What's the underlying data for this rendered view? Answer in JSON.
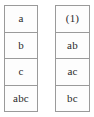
{
  "figure": {
    "type": "two-column-table-pair",
    "background_color": "#ffffff",
    "border_color": "#9a9a9a",
    "text_color": "#2a2a2a"
  },
  "tables": [
    {
      "name": "left-table",
      "rows": [
        {
          "value": "a"
        },
        {
          "value": "b"
        },
        {
          "value": "c"
        },
        {
          "value": "abc"
        }
      ]
    },
    {
      "name": "right-table",
      "rows": [
        {
          "value": "(1)"
        },
        {
          "value": "ab"
        },
        {
          "value": "ac"
        },
        {
          "value": "bc"
        }
      ]
    }
  ]
}
